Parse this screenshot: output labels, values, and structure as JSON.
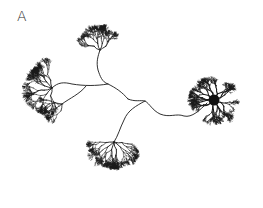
{
  "figure": {
    "panel_label": "A",
    "colors": {
      "background": "#ffffff",
      "ink": "#1a1a1a",
      "label": "#333333"
    },
    "soma": {
      "x": 214,
      "y": 100,
      "r": 6
    },
    "tufts": [
      {
        "name": "top",
        "x": 97,
        "y": 30,
        "radius": 24
      },
      {
        "name": "left",
        "x": 38,
        "y": 90,
        "radius": 30
      },
      {
        "name": "bottom",
        "x": 110,
        "y": 158,
        "radius": 30
      },
      {
        "name": "soma-arbor",
        "x": 214,
        "y": 100,
        "radius": 30
      }
    ],
    "process_path": [
      [
        188,
        112
      ],
      [
        175,
        116
      ],
      [
        160,
        112
      ],
      [
        148,
        104
      ],
      [
        136,
        102
      ],
      [
        128,
        95
      ],
      [
        112,
        84
      ],
      [
        102,
        80
      ],
      [
        95,
        68
      ],
      [
        100,
        52
      ]
    ]
  }
}
